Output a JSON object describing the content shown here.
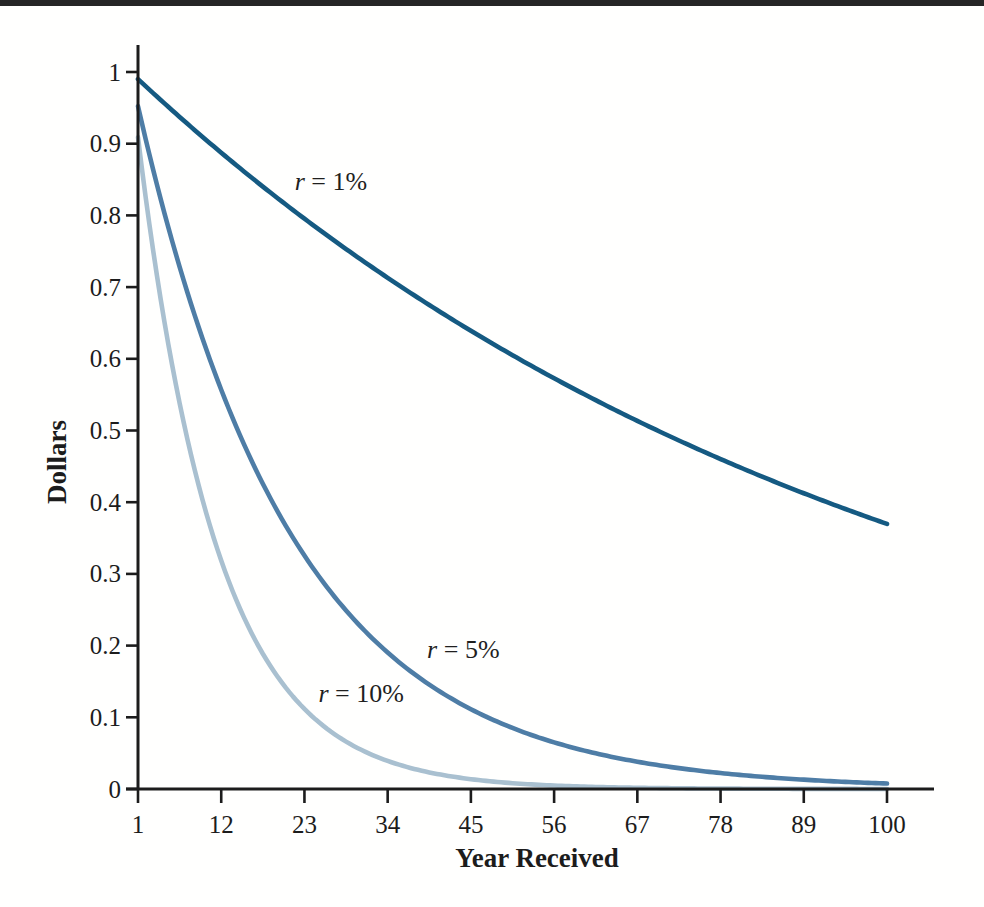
{
  "figure": {
    "top_rule_color": "#262626",
    "background_color": "#fffffe",
    "axis_color": "#1c1c1c",
    "text_color": "#1c1c1c"
  },
  "chart_data": {
    "type": "line",
    "title": "",
    "xlabel": "Year Received",
    "ylabel": "Dollars",
    "xlim": [
      1,
      100
    ],
    "ylim": [
      0,
      1
    ],
    "grid": false,
    "legend": "inline curve labels",
    "curve_formula": "present value of $1 = 1 / (1 + r)^t",
    "xtick_values": [
      1,
      12,
      23,
      34,
      45,
      56,
      67,
      78,
      89,
      100
    ],
    "xtick_labels": [
      "1",
      "12",
      "23",
      "34",
      "45",
      "56",
      "67",
      "78",
      "89",
      "100"
    ],
    "ytick_values": [
      0,
      0.1,
      0.2,
      0.3,
      0.4,
      0.5,
      0.6,
      0.7,
      0.8,
      0.9,
      1
    ],
    "ytick_labels": [
      "0",
      "0.1",
      "0.2",
      "0.3",
      "0.4",
      "0.5",
      "0.6",
      "0.7",
      "0.8",
      "0.9",
      "1"
    ],
    "series": [
      {
        "name": "r = 1%",
        "rate": 0.01,
        "color": "#155a82",
        "label": "r = 1%",
        "label_anchor": {
          "t": 26.5,
          "value": 0.848
        },
        "x_at_ticks": [
          1,
          12,
          23,
          34,
          45,
          56,
          67,
          78,
          89,
          100
        ],
        "values_at_ticks": [
          0.99,
          0.887,
          0.795,
          0.713,
          0.639,
          0.573,
          0.513,
          0.46,
          0.413,
          0.37
        ]
      },
      {
        "name": "r = 5%",
        "rate": 0.05,
        "color": "#4e7da6",
        "label": "r = 5%",
        "label_anchor": {
          "t": 44,
          "value": 0.195
        },
        "x_at_ticks": [
          1,
          12,
          23,
          34,
          45,
          56,
          67,
          78,
          89,
          100
        ],
        "values_at_ticks": [
          0.952,
          0.557,
          0.326,
          0.19,
          0.111,
          0.065,
          0.038,
          0.022,
          0.013,
          0.008
        ]
      },
      {
        "name": "r = 10%",
        "rate": 0.1,
        "color": "#a9c0d0",
        "label": "r = 10%",
        "label_anchor": {
          "t": 30.5,
          "value": 0.134
        },
        "x_at_ticks": [
          1,
          12,
          23,
          34,
          45,
          56,
          67,
          78,
          89,
          100
        ],
        "values_at_ticks": [
          0.909,
          0.319,
          0.112,
          0.039,
          0.014,
          0.005,
          0.002,
          0.001,
          0.0,
          0.0
        ]
      }
    ]
  }
}
